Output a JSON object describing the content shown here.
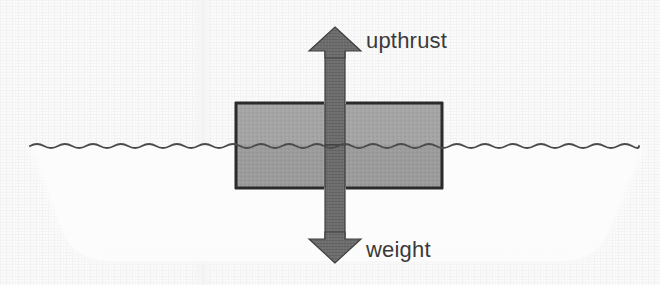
{
  "diagram": {
    "labels": {
      "upthrust": "upthrust",
      "weight": "weight"
    },
    "colors": {
      "paper_background": "#fafafa",
      "paper_texture_light": "#f2f2f2",
      "water_fill": "#fbfbfb",
      "water_line": "#4a4a4a",
      "block_fill": "#a3a3a3",
      "block_fill_submerged": "#9a9a9a",
      "block_outline": "#2b2b2b",
      "arrow_fill": "#6a6a6a",
      "arrow_outline": "#3d3d3d",
      "text": "#3a3a3a",
      "fold_line": "#ececec"
    },
    "geometry": {
      "canvas": {
        "width": 660,
        "height": 285
      },
      "water_line_y": 145,
      "water_line_x_start": 30,
      "water_line_x_end": 645,
      "water_body_top_left_x": 30,
      "water_body_top_right_x": 645,
      "water_body_bottom_left_x": 80,
      "water_body_bottom_right_x": 590,
      "water_body_bottom_y": 265,
      "block": {
        "x": 235,
        "y": 103,
        "width": 208,
        "height": 85
      },
      "arrow_shaft_width": 20,
      "arrow_center_x": 335,
      "arrow_head_width": 50,
      "upthrust_arrow": {
        "tip_y": 28,
        "tail_y": 145,
        "direction": "up"
      },
      "weight_arrow": {
        "tip_y": 262,
        "tail_y": 145,
        "direction": "down"
      },
      "fold_line_x": 203
    },
    "physics": {
      "upthrust_label_position": "right of up arrow",
      "weight_label_position": "right of down arrow",
      "block_state": "partially submerged, floating"
    }
  }
}
